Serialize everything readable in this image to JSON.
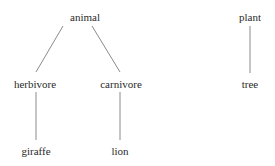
{
  "diagram": {
    "type": "tree",
    "colors": {
      "text": "#2a2a2a",
      "edge": "#8a8a8a",
      "background": "#ffffff"
    },
    "nodes": [
      {
        "id": "animal",
        "label": "animal",
        "x": 85,
        "y": 18
      },
      {
        "id": "herbivore",
        "label": "herbivore",
        "x": 35,
        "y": 85
      },
      {
        "id": "carnivore",
        "label": "carnivore",
        "x": 121,
        "y": 85
      },
      {
        "id": "giraffe",
        "label": "giraffe",
        "x": 36,
        "y": 152
      },
      {
        "id": "lion",
        "label": "lion",
        "x": 120,
        "y": 152
      },
      {
        "id": "plant",
        "label": "plant",
        "x": 250,
        "y": 18
      },
      {
        "id": "tree",
        "label": "tree",
        "x": 250,
        "y": 85
      }
    ],
    "edges": [
      {
        "from": "animal",
        "to": "herbivore",
        "x1": 63,
        "y1": 26,
        "x2": 36,
        "y2": 72
      },
      {
        "from": "animal",
        "to": "carnivore",
        "x1": 92,
        "y1": 26,
        "x2": 120,
        "y2": 72
      },
      {
        "from": "herbivore",
        "to": "giraffe",
        "x1": 36,
        "y1": 92,
        "x2": 36,
        "y2": 140
      },
      {
        "from": "carnivore",
        "to": "lion",
        "x1": 120,
        "y1": 92,
        "x2": 120,
        "y2": 140
      },
      {
        "from": "plant",
        "to": "tree",
        "x1": 250,
        "y1": 26,
        "x2": 250,
        "y2": 73
      }
    ]
  }
}
